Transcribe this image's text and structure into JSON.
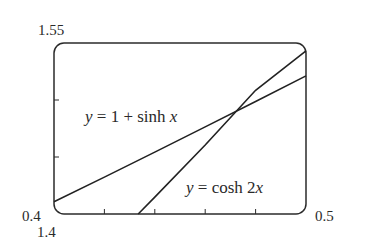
{
  "chart_data": {
    "type": "line",
    "title": "",
    "xlabel": "",
    "ylabel": "",
    "xlim": [
      0.4,
      0.5
    ],
    "ylim": [
      1.4,
      1.55
    ],
    "grid": false,
    "legend": "none (curves labeled inline)",
    "x_tick_labels": {
      "min": "0.4",
      "max": "0.5"
    },
    "y_tick_labels": {
      "min": "1.4",
      "max": "1.55"
    },
    "x_minor_ticks": [
      0.42,
      0.44,
      0.46,
      0.48
    ],
    "y_minor_ticks": [
      1.45,
      1.5
    ],
    "series": [
      {
        "name": "y = 1 + sinh x",
        "label_parts": {
          "y": "y",
          "eq": " = 1 + sinh ",
          "x": "x"
        },
        "x": [
          0.4,
          0.42,
          0.44,
          0.46,
          0.48,
          0.5
        ],
        "values": [
          1.4108,
          1.4324,
          1.4543,
          1.4764,
          1.4987,
          1.5211
        ]
      },
      {
        "name": "y = cosh 2x",
        "label_parts": {
          "y": "y",
          "eq": " = cosh 2",
          "x": "x"
        },
        "x": [
          0.4334,
          0.44,
          0.46,
          0.48,
          0.5
        ],
        "values": [
          1.4,
          1.4148,
          1.4605,
          1.5085,
          1.5431
        ]
      }
    ],
    "annotations": [
      {
        "text": "intersection",
        "x": 0.4816,
        "y": 1.5004
      }
    ]
  }
}
